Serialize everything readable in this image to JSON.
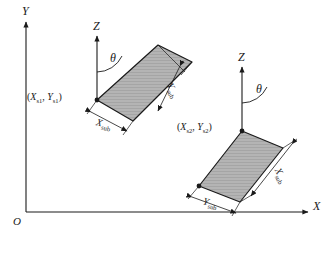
{
  "figure": {
    "background_color": "#ffffff",
    "line_color": "#1a1a1a",
    "panel_fill_color": "#b0b0b0",
    "panel_edge_color": "#1a1a1a"
  },
  "global_axes": {
    "y_label": "Y",
    "x_label": "X",
    "origin_label": "O"
  },
  "panel_1": {
    "z_label": "Z",
    "angle_label": "θ",
    "coord_label": {
      "open": "(",
      "x_sym": "X",
      "x_sub": "s1",
      "comma": ",",
      "y_sym": "Y",
      "y_sub": "s1",
      "close": ")"
    },
    "dim_width": {
      "sym": "X",
      "sub": "sub"
    },
    "dim_length": {
      "sym": "Y",
      "sub": "sub"
    }
  },
  "panel_2": {
    "z_label": "Z",
    "angle_label": "θ",
    "coord_label": {
      "open": "(",
      "x_sym": "X",
      "x_sub": "s2",
      "comma": ",",
      "y_sym": "Y",
      "y_sub": "s2",
      "close": ")"
    },
    "dim_width": {
      "sym": "X",
      "sub": "sub"
    },
    "dim_length": {
      "sym": "Y",
      "sub": "sub"
    }
  }
}
